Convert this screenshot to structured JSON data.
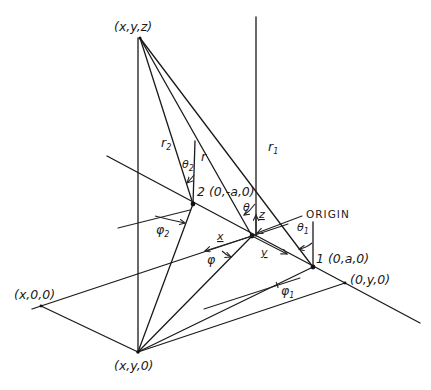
{
  "diagram": {
    "points": {
      "field_point": "(x,y,z)",
      "projection": "(x,y,0)",
      "x_axis_point": "(x,0,0)",
      "y_axis_point": "(0,y,0)",
      "point1": "1 (0,a,0)",
      "point2": "2 (0,-a,0)",
      "origin": "ORIGIN"
    },
    "distances": {
      "r": "r",
      "r1": "r",
      "r1_sub": "1",
      "r2": "r",
      "r2_sub": "2"
    },
    "angles": {
      "theta": "θ",
      "theta1": "θ",
      "theta1_sub": "1",
      "theta2": "θ",
      "theta2_sub": "2",
      "phi": "φ",
      "phi1": "φ",
      "phi1_sub": "1",
      "phi2": "φ",
      "phi2_sub": "2"
    },
    "unit_vectors": {
      "x0": "x",
      "y0": "y",
      "z0": "z"
    }
  }
}
